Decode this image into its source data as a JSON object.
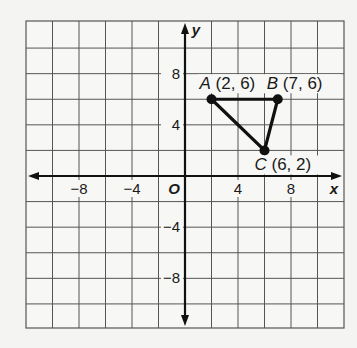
{
  "chart_data": {
    "type": "scatter",
    "title": "",
    "xlabel": "x",
    "ylabel": "y",
    "origin_label": "O",
    "xlim": [
      -12,
      12
    ],
    "ylim": [
      -12,
      12
    ],
    "grid": true,
    "grid_step": 2,
    "x_ticks": [
      {
        "value": -8,
        "label": "−8"
      },
      {
        "value": -4,
        "label": "−4"
      },
      {
        "value": 4,
        "label": "4"
      },
      {
        "value": 8,
        "label": "8"
      }
    ],
    "y_ticks": [
      {
        "value": 8,
        "label": "8"
      },
      {
        "value": 4,
        "label": "4"
      },
      {
        "value": -4,
        "label": "−4"
      },
      {
        "value": -8,
        "label": "−8"
      }
    ],
    "points": [
      {
        "name": "A",
        "x": 2,
        "y": 6,
        "label": "A (2, 6)"
      },
      {
        "name": "B",
        "x": 7,
        "y": 6,
        "label": "B (7, 6)"
      },
      {
        "name": "C",
        "x": 6,
        "y": 2,
        "label": "C (6, 2)"
      }
    ],
    "polygon": [
      "A",
      "B",
      "C"
    ],
    "colors": {
      "grid": "#555555",
      "axis": "#111111",
      "shape": "#111111"
    }
  }
}
